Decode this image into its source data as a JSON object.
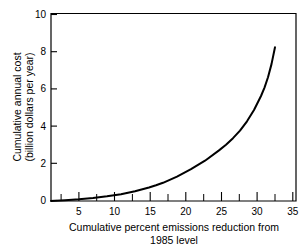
{
  "chart_data": {
    "type": "line",
    "title": "",
    "subtitle": "",
    "xlabel": "Cumulative percent emissions reduction from 1985 level",
    "xlabel_line1": "Cumulative percent emissions reduction from",
    "xlabel_line2": "1985 level",
    "ylabel": "Cumulative annual cost (billion dollars per year)",
    "ylabel_line1": "Cumulative annual cost",
    "ylabel_line2": "(billion dollars per year)",
    "xlim": [
      0,
      35
    ],
    "ylim": [
      0,
      10
    ],
    "grid": false,
    "legend": false,
    "legend_position": "none",
    "xticks": [
      5,
      10,
      15,
      20,
      25,
      30,
      35
    ],
    "xtick_labels": [
      "5",
      "10",
      "15",
      "20",
      "25",
      "30",
      "35"
    ],
    "xticks_minor": [
      2.5,
      7.5,
      12.5,
      17.5,
      22.5,
      27.5,
      32.5
    ],
    "yticks": [
      0,
      2,
      4,
      6,
      8,
      10
    ],
    "ytick_labels": [
      "0",
      "2",
      "4",
      "6",
      "8",
      "10"
    ],
    "series": [
      {
        "name": "Cumulative annual cost",
        "color": "#000000",
        "x": [
          0,
          2,
          4,
          6,
          8,
          10,
          12,
          14,
          15,
          16,
          18,
          20,
          22,
          24,
          25,
          26,
          27,
          28,
          29,
          30,
          30.5,
          31,
          31.5,
          32
        ],
        "values": [
          0.0,
          0.04,
          0.09,
          0.16,
          0.25,
          0.36,
          0.52,
          0.72,
          0.84,
          0.97,
          1.3,
          1.7,
          2.15,
          2.7,
          3.0,
          3.35,
          3.75,
          4.25,
          4.85,
          5.6,
          6.05,
          6.6,
          7.3,
          8.2
        ]
      }
    ],
    "annotations": []
  },
  "axes": {
    "x_axis_name": "x-axis",
    "y_axis_name": "y-axis"
  }
}
